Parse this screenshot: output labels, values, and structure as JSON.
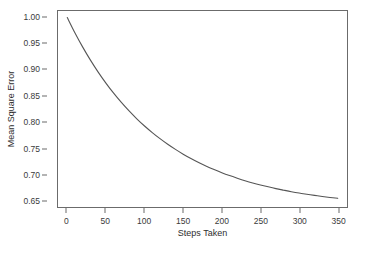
{
  "chart_data": {
    "type": "line",
    "title": "",
    "xlabel": "Steps Taken",
    "ylabel": "Mean Square Error",
    "xlim": [
      -12,
      362
    ],
    "ylim": [
      0.6375,
      1.0125
    ],
    "xticks": [
      0,
      50,
      100,
      150,
      200,
      250,
      300,
      350
    ],
    "xtick_labels": [
      "0",
      "50",
      "100",
      "150",
      "200",
      "250",
      "300",
      "350"
    ],
    "yticks": [
      0.65,
      0.7,
      0.75,
      0.8,
      0.85,
      0.9,
      0.95,
      1.0
    ],
    "ytick_labels": [
      "0.65",
      "0.70",
      "0.75",
      "0.80",
      "0.85",
      "0.90",
      "0.95",
      "1.00"
    ],
    "grid": false,
    "legend": null,
    "series": [
      {
        "name": "Mean Square Error",
        "color": "#555555",
        "line_width": 1.1,
        "x": [
          0,
          10,
          20,
          30,
          40,
          50,
          60,
          70,
          80,
          90,
          100,
          110,
          120,
          130,
          140,
          150,
          160,
          170,
          180,
          190,
          200,
          210,
          220,
          230,
          240,
          250,
          260,
          270,
          280,
          290,
          300,
          310,
          320,
          330,
          340,
          350
        ],
        "y": [
          1.0,
          0.9705,
          0.9434,
          0.9185,
          0.8956,
          0.8746,
          0.8553,
          0.8376,
          0.8213,
          0.8063,
          0.7925,
          0.7799,
          0.7682,
          0.7575,
          0.7477,
          0.7386,
          0.7303,
          0.7226,
          0.7156,
          0.7091,
          0.7031,
          0.6976,
          0.6926,
          0.6879,
          0.6836,
          0.6797,
          0.6761,
          0.6727,
          0.6697,
          0.6668,
          0.6642,
          0.6619,
          0.6597,
          0.6577,
          0.6558,
          0.6541
        ]
      }
    ]
  }
}
